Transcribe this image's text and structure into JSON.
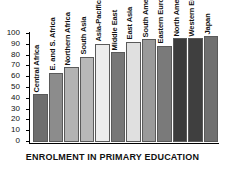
{
  "chart_data": {
    "type": "bar",
    "title": "",
    "xlabel": "ENROLMENT IN PRIMARY EDUCATION",
    "ylabel": "",
    "ylim": [
      0,
      100
    ],
    "yticks": [
      0,
      10,
      20,
      30,
      40,
      50,
      60,
      70,
      80,
      90,
      100
    ],
    "grid": false,
    "legend": "none",
    "categories": [
      "Central Africa",
      "E. and S. Africa",
      "Northern Africa",
      "South Asia",
      "Asia-Pacific",
      "Middle East",
      "East Asia",
      "South America",
      "Eastern Europe",
      "North America",
      "Western Europe",
      "Japan"
    ],
    "values": [
      44,
      64,
      69,
      79,
      91,
      83,
      93,
      95,
      89,
      96,
      96,
      98
    ],
    "bar_colors": [
      "#6e6e6e",
      "#8c8c8c",
      "#b3b3b3",
      "#b8b8b8",
      "#ededed",
      "#777777",
      "#e0e0e0",
      "#9a9a9a",
      "#7a7a7a",
      "#3b3b3b",
      "#3f3f3f",
      "#707070"
    ]
  },
  "axis": {
    "tick_labels": [
      "100",
      "90",
      "80",
      "70",
      "60",
      "50",
      "40",
      "30",
      "20",
      "10",
      "0"
    ]
  }
}
